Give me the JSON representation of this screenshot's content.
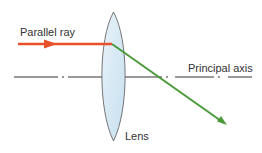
{
  "diagram": {
    "labels": {
      "parallel_ray": "Parallel ray",
      "principal_axis": "Principal axis",
      "lens": "Lens"
    },
    "colors": {
      "incident_ray": "#e8502a",
      "refracted_ray": "#4a9a3a",
      "lens_fill": "#d6e8f3",
      "lens_outline": "#555555",
      "axis": "#333333",
      "text": "#333333"
    }
  }
}
